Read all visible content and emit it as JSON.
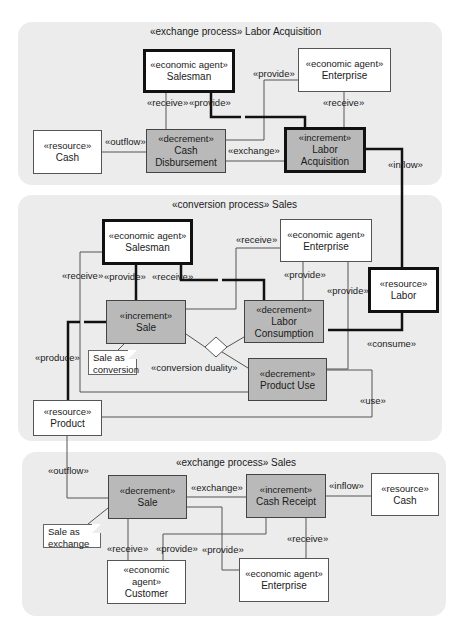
{
  "panels": [
    {
      "id": "labor-acquisition",
      "stereotype": "«exchange process»",
      "name": "Labor Acquisition"
    },
    {
      "id": "conversion-sales",
      "stereotype": "«conversion process»",
      "name": "Sales"
    },
    {
      "id": "exchange-sales",
      "stereotype": "«exchange process»",
      "name": "Sales"
    }
  ],
  "p1": {
    "salesman": {
      "stereotype": "«economic agent»",
      "name": "Salesman"
    },
    "enterprise": {
      "stereotype": "«economic agent»",
      "name": "Enterprise"
    },
    "cash": {
      "stereotype": "«resource»",
      "name": "Cash"
    },
    "cash_disbursement": {
      "stereotype": "«decrement»",
      "name1": "Cash",
      "name2": "Disbursement"
    },
    "labor_acquisition": {
      "stereotype": "«increment»",
      "name1": "Labor",
      "name2": "Acquisition"
    },
    "labels": {
      "provide_enterprise": "«provide»",
      "receive_salesman": "«receive»",
      "provide_salesman": "«provide»",
      "receive_enterprise": "«receive»",
      "outflow": "«outflow»",
      "exchange": "«exchange»",
      "inflow": "«inflow»"
    }
  },
  "p2": {
    "salesman": {
      "stereotype": "«economic agent»",
      "name": "Salesman"
    },
    "enterprise": {
      "stereotype": "«economic agent»",
      "name": "Enterprise"
    },
    "labor": {
      "stereotype": "«resource»",
      "name": "Labor"
    },
    "sale": {
      "stereotype": "«increment»",
      "name": "Sale"
    },
    "labor_consumption": {
      "stereotype": "«decrement»",
      "name1": "Labor",
      "name2": "Consumption"
    },
    "product_use": {
      "stereotype": "«decrement»",
      "name": "Product Use"
    },
    "product": {
      "stereotype": "«resource»",
      "name": "Product"
    },
    "note": {
      "line1": "Sale as",
      "line2": "conversion"
    },
    "labels": {
      "receive_left": "«receive»",
      "provide": "«provide»",
      "receive_mid": "«receive»",
      "receive_enterprise": "«receive»",
      "provide_enterprise1": "«provide»",
      "provide_enterprise2": "«provide»",
      "produce": "«produce»",
      "conversion_duality": "«conversion duality»",
      "consume": "«consume»",
      "use": "«use»"
    }
  },
  "p3": {
    "sale": {
      "stereotype": "«decrement»",
      "name": "Sale"
    },
    "cash_receipt": {
      "stereotype": "«increment»",
      "name": "Cash Receipt"
    },
    "cash": {
      "stereotype": "«resource»",
      "name": "Cash"
    },
    "customer": {
      "stereotype": "«economic agent»",
      "name": "Customer"
    },
    "enterprise": {
      "stereotype": "«economic agent»",
      "name": "Enterprise"
    },
    "note": {
      "line1": "Sale as",
      "line2": "exchange"
    },
    "labels": {
      "outflow": "«outflow»",
      "exchange": "«exchange»",
      "inflow": "«inflow»",
      "receive_customer": "«receive»",
      "provide_customer": "«provide»",
      "provide_enterprise": "«provide»",
      "receive_enterprise": "«receive»"
    }
  },
  "colors": {
    "panel_bg": "#ececec",
    "event_fill": "#b9b9b9",
    "agent_fill": "#ffffff",
    "line": "#555555",
    "thick_line": "#111111"
  }
}
